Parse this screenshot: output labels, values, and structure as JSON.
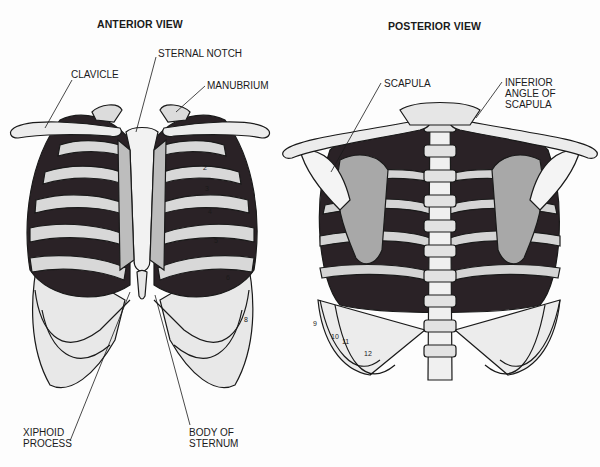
{
  "diagram": {
    "anterior": {
      "title": "ANTERIOR VIEW",
      "labels": {
        "sternal_notch": "STERNAL NOTCH",
        "clavicle": "CLAVICLE",
        "manubrium": "MANUBRIUM",
        "xiphoid_process": "XIPHOID\nPROCESS",
        "body_of_sternum": "BODY OF\nSTERNUM"
      },
      "rib_numbers": [
        "2",
        "3",
        "4",
        "5",
        "6",
        "8"
      ]
    },
    "posterior": {
      "title": "POSTERIOR VIEW",
      "labels": {
        "scapula": "SCAPULA",
        "inferior_angle_of_scapula": "INFERIOR\nANGLE OF\nSCAPULA"
      },
      "rib_numbers": [
        "9",
        "10",
        "11",
        "12"
      ]
    },
    "colors": {
      "ink": "#1a1a1a",
      "bone": "#e6e6e6",
      "cavity": "#2a2226",
      "scapula_shade": "#a8a8a8",
      "cartilage": "#c4c4c4"
    }
  }
}
